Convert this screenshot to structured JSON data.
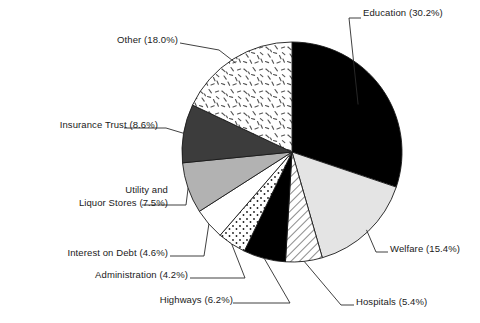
{
  "chart_data": {
    "type": "pie",
    "title": "",
    "subtitle": "",
    "xlabel": "",
    "ylabel": "",
    "grid": false,
    "legend_position": "callout-labels",
    "start_angle_deg": 0,
    "direction": "clockwise",
    "units": "percent",
    "categories": [
      "Education",
      "Welfare",
      "Hospitals",
      "Highways",
      "Administration",
      "Interest on Debt",
      "Utility and Liquor Stores",
      "Insurance Trust",
      "Other"
    ],
    "values": [
      30.2,
      15.4,
      5.4,
      6.2,
      4.2,
      4.6,
      7.5,
      8.6,
      18.0
    ],
    "slices": [
      {
        "name": "Education",
        "value": 30.2,
        "label": "Education (30.2%)",
        "fill": "solid-black",
        "color": "#000000"
      },
      {
        "name": "Welfare",
        "value": 15.4,
        "label": "Welfare (15.4%)",
        "fill": "solid-light-gray",
        "color": "#e4e4e4"
      },
      {
        "name": "Hospitals",
        "value": 5.4,
        "label": "Hospitals (5.4%)",
        "fill": "diagonal-hatch",
        "color": "#ffffff"
      },
      {
        "name": "Highways",
        "value": 6.2,
        "label": "Highways (6.2%)",
        "fill": "solid-black",
        "color": "#111111"
      },
      {
        "name": "Administration",
        "value": 4.2,
        "label": "Administration (4.2%)",
        "fill": "dotted",
        "color": "#ffffff"
      },
      {
        "name": "Interest on Debt",
        "value": 4.6,
        "label": "Interest on Debt (4.6%)",
        "fill": "solid-white",
        "color": "#ffffff"
      },
      {
        "name": "Utility and Liquor Stores",
        "value": 7.5,
        "label_line1": "Utility and",
        "label_line2": "Liquor Stores (7.5%)",
        "fill": "solid-medium-gray",
        "color": "#b2b2b2"
      },
      {
        "name": "Insurance Trust",
        "value": 8.6,
        "label": "Insurance Trust (8.6%)",
        "fill": "solid-dark-gray",
        "color": "#3c3c3c"
      },
      {
        "name": "Other",
        "value": 18.0,
        "label": "Other (18.0%)",
        "fill": "confetti-dashes",
        "color": "#ffffff"
      }
    ]
  },
  "geometry": {
    "center_x": 292,
    "center_y": 152,
    "radius": 110,
    "stroke": "#1a1a1a"
  },
  "labels": {
    "education": "Education (30.2%)",
    "welfare": "Welfare (15.4%)",
    "hospitals": "Hospitals (5.4%)",
    "highways": "Highways (6.2%)",
    "administration": "Administration (4.2%)",
    "interest_on_debt": "Interest on Debt (4.6%)",
    "utility_line1": "Utility and",
    "utility_line2": "Liquor Stores (7.5%)",
    "insurance_trust": "Insurance Trust (8.6%)",
    "other": "Other (18.0%)"
  }
}
